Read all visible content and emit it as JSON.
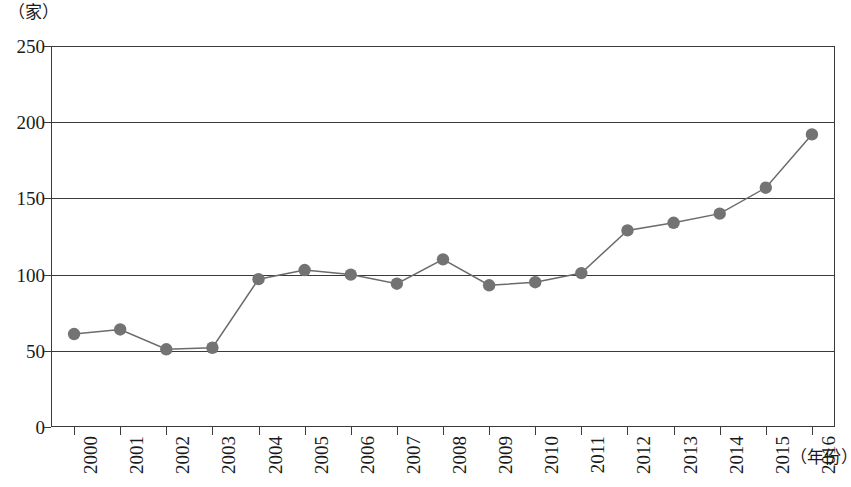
{
  "chart_data": {
    "type": "line",
    "title": "",
    "subtitle": "",
    "xlabel": "（年份）",
    "ylabel": "（家）",
    "y_unit": "（家）",
    "x_unit": "（年份）",
    "categories": [
      "2000",
      "2001",
      "2002",
      "2003",
      "2004",
      "2005",
      "2006",
      "2007",
      "2008",
      "2009",
      "2010",
      "2011",
      "2012",
      "2013",
      "2014",
      "2015",
      "2016"
    ],
    "values": [
      61,
      64,
      51,
      52,
      97,
      103,
      100,
      94,
      110,
      93,
      95,
      101,
      129,
      134,
      140,
      157,
      192
    ],
    "series": [
      {
        "name": "",
        "values": [
          61,
          64,
          51,
          52,
          97,
          103,
          100,
          94,
          110,
          93,
          95,
          101,
          129,
          134,
          140,
          157,
          192
        ]
      }
    ],
    "y_ticks": [
      0,
      50,
      100,
      150,
      200,
      250
    ],
    "ylim": [
      0,
      250
    ],
    "xlim_categories": [
      "2000",
      "2016"
    ],
    "grid": true,
    "grid_axis": "y",
    "legend": false,
    "legend_position": "none",
    "marker": "circle",
    "marker_color": "#737373",
    "line_color": "#6b6b6b",
    "axis_color": "#3a3a3a",
    "background_color": "#ffffff"
  }
}
